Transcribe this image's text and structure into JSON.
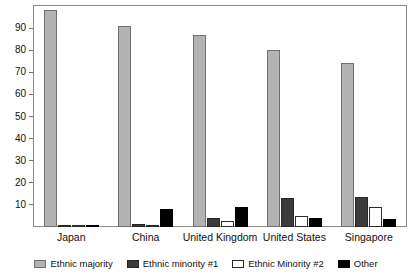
{
  "chart_data": {
    "type": "bar",
    "title": "",
    "xlabel": "",
    "ylabel": "",
    "ylim": [
      0,
      100
    ],
    "grid": false,
    "legend_position": "bottom",
    "categories": [
      "Japan",
      "China",
      "United Kingdom",
      "United States",
      "Singapore"
    ],
    "ytick_labels": [
      "90",
      "80",
      "70",
      "60",
      "50",
      "40",
      "30",
      "20",
      "10"
    ],
    "ytick_values": [
      90,
      80,
      70,
      60,
      50,
      40,
      30,
      20,
      10
    ],
    "series": [
      {
        "name": "Ethnic majority",
        "color": "#b3b3b3",
        "values": [
          98,
          91,
          87,
          80,
          74
        ]
      },
      {
        "name": "Ethnic minority #1",
        "color": "#3b3b3b",
        "values": [
          0.6,
          1.5,
          4,
          13,
          13.5
        ]
      },
      {
        "name": "Ethnic Minority #2",
        "color": "#ffffff",
        "values": [
          0.4,
          0.5,
          2.5,
          5,
          9
        ]
      },
      {
        "name": "Other",
        "color": "#000000",
        "values": [
          0.5,
          8,
          9,
          4,
          3.5
        ]
      }
    ]
  },
  "legend": {
    "items": [
      {
        "label": "Ethnic majority"
      },
      {
        "label": "Ethnic minority #1"
      },
      {
        "label": "Ethnic Minority #2"
      },
      {
        "label": "Other"
      }
    ]
  }
}
